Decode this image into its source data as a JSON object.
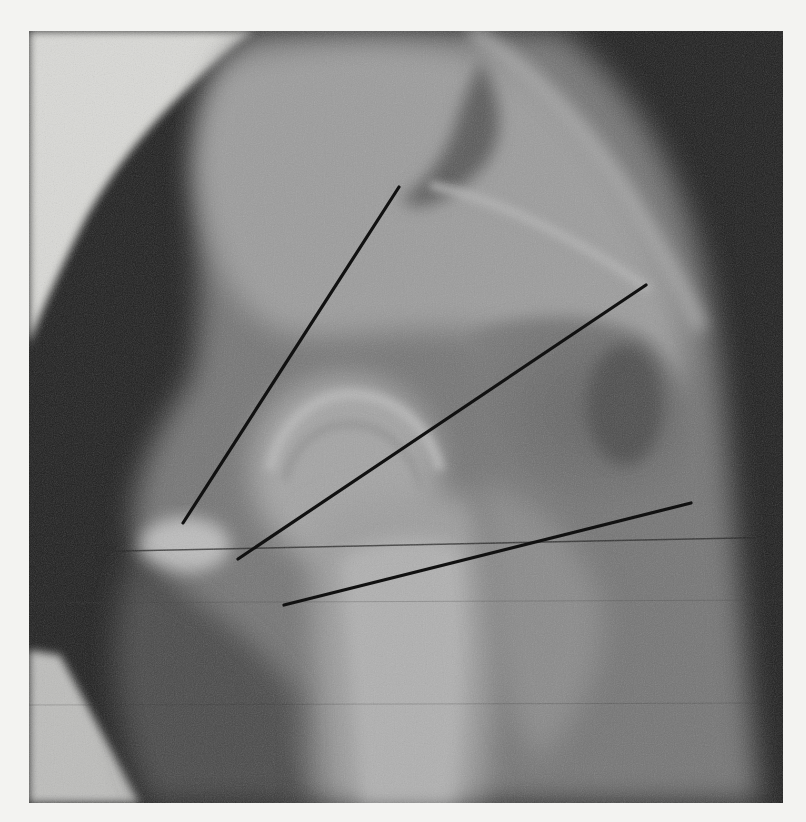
{
  "image": {
    "kind": "radiograph",
    "description": "Grayscale X-ray of a hip joint (femoral head in acetabulum) with three black measurement lines radiating from a lateral point",
    "frame": {
      "x": 29,
      "y": 31,
      "width": 754,
      "height": 772
    },
    "colors": {
      "paper": "#f3f3f1",
      "background_dark": "#1e1e1e",
      "bone_light": "#b4b4b4",
      "soft_tissue": "#6e6e6e",
      "annotation_line": "#111111"
    }
  },
  "annotations": {
    "lines": [
      {
        "id": "line-1",
        "x1": 399,
        "y1": 187,
        "x2": 183,
        "y2": 523
      },
      {
        "id": "line-2",
        "x1": 646,
        "y1": 285,
        "x2": 238,
        "y2": 559
      },
      {
        "id": "line-3",
        "x1": 691,
        "y1": 503,
        "x2": 284,
        "y2": 605
      }
    ],
    "scan_artifact": {
      "x1": 29,
      "y1": 553,
      "x2": 783,
      "y2": 537
    }
  }
}
